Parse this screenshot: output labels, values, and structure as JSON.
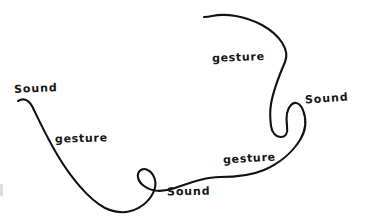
{
  "diagram": {
    "background_color": "#ffffff",
    "stroke_color": "#111111",
    "width": 366,
    "height": 223,
    "style": "hand-drawn ink sketch",
    "labels": [
      {
        "id": "sound-left",
        "text": "Sound",
        "kind": "sound",
        "x": 14,
        "y": 83
      },
      {
        "id": "gesture-left",
        "text": "gesture",
        "kind": "gesture",
        "x": 55,
        "y": 133
      },
      {
        "id": "sound-bottom",
        "text": "Sound",
        "kind": "sound",
        "x": 167,
        "y": 186
      },
      {
        "id": "gesture-mid",
        "text": "gesture",
        "kind": "gesture",
        "x": 223,
        "y": 153
      },
      {
        "id": "gesture-top",
        "text": "gesture",
        "kind": "gesture",
        "x": 212,
        "y": 52
      },
      {
        "id": "sound-right",
        "text": "Sound",
        "kind": "sound",
        "x": 305,
        "y": 93
      }
    ],
    "curve": {
      "description": "single continuous freehand line with two tight hooks marking Sound points",
      "path": "M 18 101 C 23 98 28 99 32 106 C 38 118 46 136 58 156 C 70 176 88 199 105 208 C 118 214 131 214 143 205 C 152 198 157 188 155 180 C 153 172 146 167 141 170 C 136 173 137 181 144 186 C 152 192 163 192 175 188 C 190 183 205 177 220 177 C 235 177 250 176 264 170 C 278 164 292 153 300 140 C 307 129 306 118 303 110 C 300 103 295 101 291 105 C 287 109 286 118 287 126 C 288 133 286 137 281 137 C 276 137 272 133 271 126 C 270 118 270 110 271 104 C 273 92 279 76 285 62 C 290 50 280 35 262 25 C 245 16 226 13 212 16 C 208 17 206 17 204 17"
    },
    "artifact": {
      "present": true,
      "x": 0,
      "y": 184
    }
  }
}
